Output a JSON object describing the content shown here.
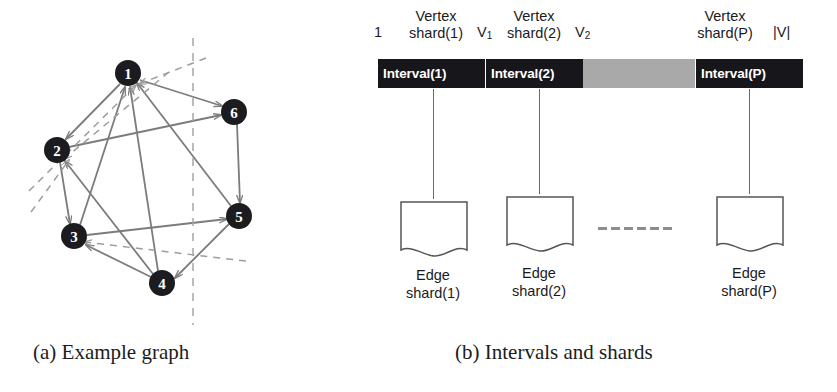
{
  "figure": {
    "panel_a": {
      "caption": "(a) Example graph",
      "graph": {
        "nodes": [
          {
            "id": "1",
            "label": "1",
            "x": 128,
            "y": 73
          },
          {
            "id": "2",
            "label": "2",
            "x": 57,
            "y": 150
          },
          {
            "id": "3",
            "label": "3",
            "x": 74,
            "y": 236
          },
          {
            "id": "4",
            "label": "4",
            "x": 162,
            "y": 283
          },
          {
            "id": "5",
            "label": "5",
            "x": 239,
            "y": 216
          },
          {
            "id": "6",
            "label": "6",
            "x": 234,
            "y": 112
          }
        ],
        "edges": [
          {
            "from": "1",
            "to": "2"
          },
          {
            "from": "1",
            "to": "6"
          },
          {
            "from": "2",
            "to": "3"
          },
          {
            "from": "2",
            "to": "6"
          },
          {
            "from": "3",
            "to": "5"
          },
          {
            "from": "4",
            "to": "1"
          },
          {
            "from": "4",
            "to": "3"
          },
          {
            "from": "4",
            "to": "2"
          },
          {
            "from": "5",
            "to": "1"
          },
          {
            "from": "5",
            "to": "4"
          },
          {
            "from": "6",
            "to": "5"
          },
          {
            "from": "3",
            "to": "1"
          }
        ],
        "partition_line": {
          "x": 193,
          "y1": 38,
          "y2": 325,
          "style": "dashed"
        },
        "cut_edges_style": "dashed",
        "node_fill": "#1c1b1f",
        "node_text_color": "#ffffff",
        "edge_color": "#7c7c7c"
      }
    },
    "panel_b": {
      "caption": "(b) Intervals and shards",
      "axis_labels": [
        {
          "name": "start",
          "text": "1"
        },
        {
          "name": "v1",
          "text": "V",
          "subscript": "1"
        },
        {
          "name": "v2",
          "text": "V",
          "subscript": "2"
        },
        {
          "name": "end",
          "text": "|V|"
        }
      ],
      "vertex_shards": [
        {
          "line1": "Vertex",
          "line2": "shard(1)"
        },
        {
          "line1": "Vertex",
          "line2": "shard(2)"
        },
        {
          "line1": "Vertex",
          "line2": "shard(P)"
        }
      ],
      "intervals": [
        {
          "label": "Interval(1)",
          "color": "#17161a"
        },
        {
          "label": "Interval(2)",
          "color": "#17161a"
        },
        {
          "label": "",
          "color": "#a9a9a9"
        },
        {
          "label": "Interval(P)",
          "color": "#17161a"
        }
      ],
      "edge_shards": [
        {
          "line1": "Edge",
          "line2": "shard(1)"
        },
        {
          "line1": "Edge",
          "line2": "shard(2)"
        },
        {
          "line1": "Edge",
          "line2": "shard(P)"
        }
      ],
      "ellipsis_dashes": 6
    }
  }
}
